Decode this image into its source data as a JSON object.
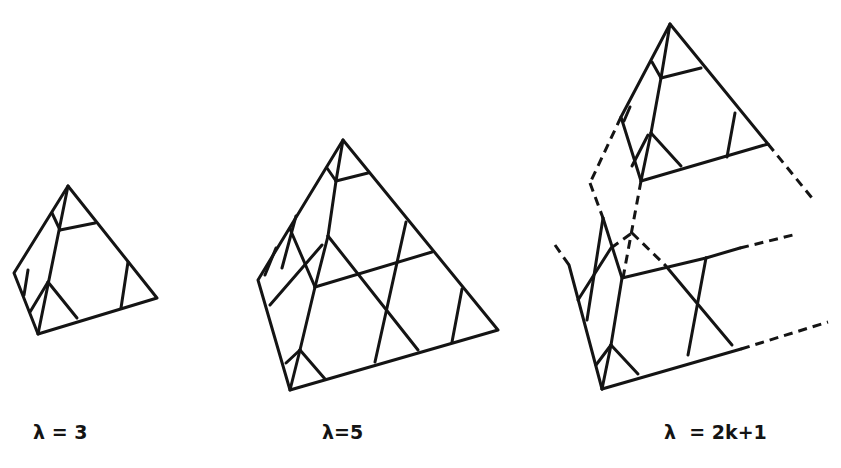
{
  "figure": {
    "colors": {
      "ink": "#141414",
      "background": "#ffffff"
    },
    "panels": [
      {
        "id": "lambda-3",
        "label": "λ = 3"
      },
      {
        "id": "lambda-5",
        "label": "λ=5"
      },
      {
        "id": "lambda-2k1",
        "label": "λ  = 2k+1"
      }
    ]
  }
}
